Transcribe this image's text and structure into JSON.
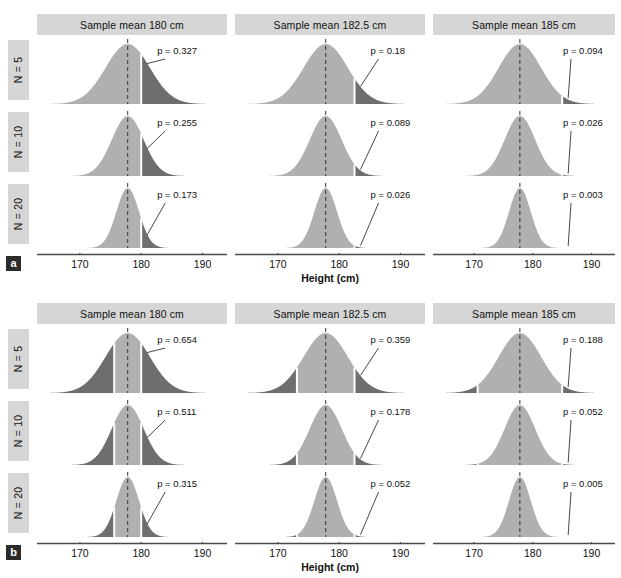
{
  "figure": {
    "axis_title": "Height (cm)",
    "tick_labels": [
      "170",
      "180",
      "190"
    ],
    "tick_values": [
      170,
      180,
      190
    ],
    "x_range": [
      163,
      194
    ],
    "null_mean": 177.8,
    "colors": {
      "curve_light": "#b0b0b0",
      "curve_dark": "#6e6e6e",
      "band": "#d6d6d6",
      "axis": "#4a4a4a",
      "text": "#111111",
      "badge_bg": "#2b2b2b",
      "badge_text": "#ffffff",
      "separator": "#ffffff"
    },
    "row_labels": [
      "N = 5",
      "N = 10",
      "N = 20"
    ],
    "column_headers": [
      "Sample mean 180 cm",
      "Sample mean 182.5 cm",
      "Sample mean 185 cm"
    ]
  },
  "panels": [
    {
      "letter": "a",
      "tails": "one-tailed",
      "cells": [
        {
          "row": "N = 5",
          "column": "Sample mean 180 cm",
          "p_label": "p = 0.327",
          "p_value": 0.327,
          "sd": 3.6,
          "cut_upper": 180
        },
        {
          "row": "N = 5",
          "column": "Sample mean 182.5 cm",
          "p_label": "p = 0.18",
          "p_value": 0.18,
          "sd": 3.6,
          "cut_upper": 182.5
        },
        {
          "row": "N = 5",
          "column": "Sample mean 185 cm",
          "p_label": "p = 0.094",
          "p_value": 0.094,
          "sd": 3.6,
          "cut_upper": 185
        },
        {
          "row": "N = 10",
          "column": "Sample mean 180 cm",
          "p_label": "p = 0.255",
          "p_value": 0.255,
          "sd": 2.6,
          "cut_upper": 180
        },
        {
          "row": "N = 10",
          "column": "Sample mean 182.5 cm",
          "p_label": "p = 0.089",
          "p_value": 0.089,
          "sd": 2.6,
          "cut_upper": 182.5
        },
        {
          "row": "N = 10",
          "column": "Sample mean 185 cm",
          "p_label": "p = 0.026",
          "p_value": 0.026,
          "sd": 2.6,
          "cut_upper": 185
        },
        {
          "row": "N = 20",
          "column": "Sample mean 180 cm",
          "p_label": "p = 0.173",
          "p_value": 0.173,
          "sd": 1.85,
          "cut_upper": 180
        },
        {
          "row": "N = 20",
          "column": "Sample mean 182.5 cm",
          "p_label": "p = 0.026",
          "p_value": 0.026,
          "sd": 1.85,
          "cut_upper": 182.5
        },
        {
          "row": "N = 20",
          "column": "Sample mean 185 cm",
          "p_label": "p = 0.003",
          "p_value": 0.003,
          "sd": 1.85,
          "cut_upper": 185
        }
      ]
    },
    {
      "letter": "b",
      "tails": "two-tailed",
      "cells": [
        {
          "row": "N = 5",
          "column": "Sample mean 180 cm",
          "p_label": "p = 0.654",
          "p_value": 0.654,
          "sd": 3.6,
          "cut_upper": 180,
          "cut_lower": 175.6
        },
        {
          "row": "N = 5",
          "column": "Sample mean 182.5 cm",
          "p_label": "p = 0.359",
          "p_value": 0.359,
          "sd": 3.6,
          "cut_upper": 182.5,
          "cut_lower": 173.1
        },
        {
          "row": "N = 5",
          "column": "Sample mean 185 cm",
          "p_label": "p = 0.188",
          "p_value": 0.188,
          "sd": 3.6,
          "cut_upper": 185,
          "cut_lower": 170.6
        },
        {
          "row": "N = 10",
          "column": "Sample mean 180 cm",
          "p_label": "p = 0.511",
          "p_value": 0.511,
          "sd": 2.6,
          "cut_upper": 180,
          "cut_lower": 175.6
        },
        {
          "row": "N = 10",
          "column": "Sample mean 182.5 cm",
          "p_label": "p = 0.178",
          "p_value": 0.178,
          "sd": 2.6,
          "cut_upper": 182.5,
          "cut_lower": 173.1
        },
        {
          "row": "N = 10",
          "column": "Sample mean 185 cm",
          "p_label": "p = 0.052",
          "p_value": 0.052,
          "sd": 2.6,
          "cut_upper": 185,
          "cut_lower": 170.6
        },
        {
          "row": "N = 20",
          "column": "Sample mean 180 cm",
          "p_label": "p = 0.315",
          "p_value": 0.315,
          "sd": 1.85,
          "cut_upper": 180,
          "cut_lower": 175.6
        },
        {
          "row": "N = 20",
          "column": "Sample mean 182.5 cm",
          "p_label": "p = 0.052",
          "p_value": 0.052,
          "sd": 1.85,
          "cut_upper": 182.5,
          "cut_lower": 173.1
        },
        {
          "row": "N = 20",
          "column": "Sample mean 185 cm",
          "p_label": "p = 0.005",
          "p_value": 0.005,
          "sd": 1.85,
          "cut_upper": 185,
          "cut_lower": 170.6
        }
      ]
    }
  ],
  "chart_data": {
    "type": "area",
    "title": "",
    "xlabel": "Height (cm)",
    "ylabel": "",
    "xlim": [
      163,
      194
    ],
    "grid": false,
    "legend": "none",
    "null_mean": 177.8,
    "row_categories": [
      "N = 5",
      "N = 10",
      "N = 20"
    ],
    "row_sd": [
      3.6,
      2.6,
      1.85
    ],
    "column_categories": [
      "Sample mean 180 cm",
      "Sample mean 182.5 cm",
      "Sample mean 185 cm"
    ],
    "column_observed_mean": [
      180,
      182.5,
      185
    ],
    "series": [
      {
        "name": "a / one-tailed",
        "values": [
          0.327,
          0.18,
          0.094,
          0.255,
          0.089,
          0.026,
          0.173,
          0.026,
          0.003
        ]
      },
      {
        "name": "b / two-tailed",
        "values": [
          0.654,
          0.359,
          0.188,
          0.511,
          0.178,
          0.052,
          0.315,
          0.052,
          0.005
        ]
      }
    ],
    "tick_values": [
      170,
      180,
      190
    ]
  }
}
